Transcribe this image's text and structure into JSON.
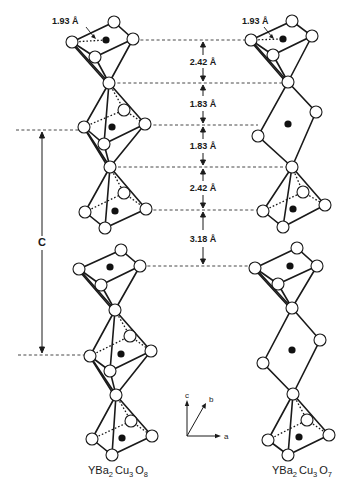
{
  "figure": {
    "type": "crystal-structure-comparison",
    "structures": [
      {
        "name": "YBa2Cu3O8",
        "label_parts": [
          "YBa",
          "2",
          "Cu",
          "3",
          "O",
          "8"
        ],
        "chain_units": [
          "pyramid",
          "octahedron",
          "pyramid",
          "pyramid",
          "octahedron",
          "pyramid"
        ]
      },
      {
        "name": "YBa2Cu3O7",
        "label_parts": [
          "YBa",
          "2",
          "Cu",
          "3",
          "O",
          "7"
        ],
        "chain_units": [
          "pyramid",
          "square-plane",
          "pyramid",
          "pyramid",
          "square-plane",
          "pyramid"
        ]
      }
    ],
    "bond_length_label": "1.93 Å",
    "interlayer_distances": [
      "2.42 Å",
      "1.83 Å",
      "1.83 Å",
      "2.42 Å",
      "3.18 Å"
    ],
    "lattice_parameter_label": "C",
    "axes": {
      "c": "c",
      "b": "b",
      "a": "a"
    },
    "legend": {
      "open_circle": "oxygen",
      "filled_dot": "copper"
    }
  }
}
